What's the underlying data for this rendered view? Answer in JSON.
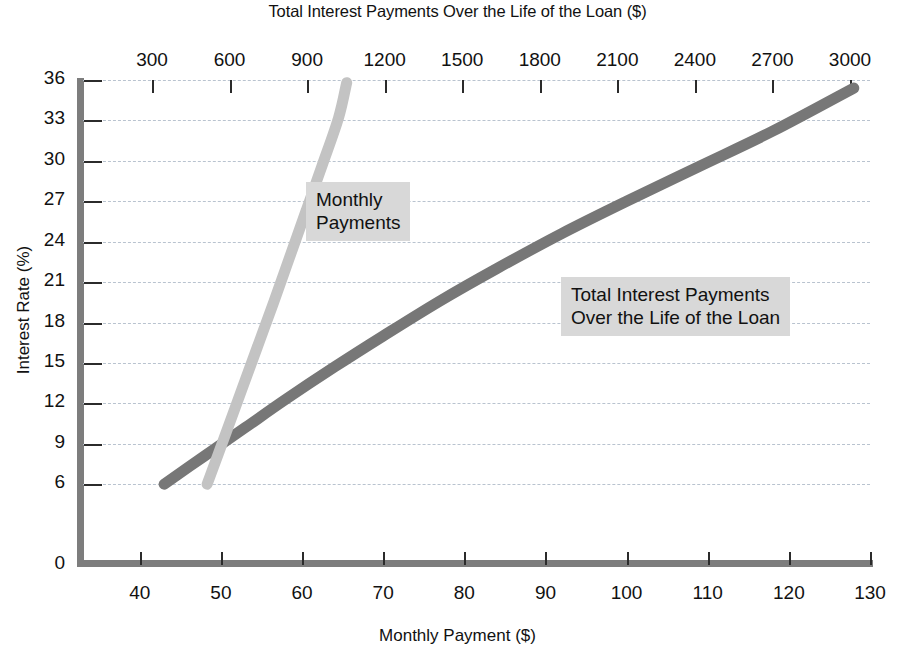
{
  "chart_data": {
    "type": "line",
    "title": "Total Interest Payments Over the Life of the Loan ($)",
    "xlabel": "Monthly Payment ($)",
    "ylabel": "Interest Rate (%)",
    "top_axis_label": "Total Interest Payments Over the Life of the Loan ($)",
    "grid": true,
    "legend_position": "inline-annotations",
    "xlim": [
      33,
      130
    ],
    "ylim": [
      0,
      36
    ],
    "top_xlim": [
      0,
      3060
    ],
    "x_ticks": [
      40,
      50,
      60,
      70,
      80,
      90,
      100,
      110,
      120,
      130
    ],
    "y_ticks": [
      0,
      6,
      9,
      12,
      15,
      18,
      21,
      24,
      27,
      30,
      33,
      36
    ],
    "top_ticks": [
      300,
      600,
      900,
      1200,
      1500,
      1800,
      2100,
      2400,
      2700,
      3000
    ],
    "series": [
      {
        "name": "Monthly Payments",
        "color": "#c3c3c3",
        "axis": "bottom",
        "x": [
          48.3,
          50.5,
          52.5,
          54.5,
          56.5,
          58.5,
          60.5,
          62.5,
          64.5,
          65.5
        ],
        "values": [
          6,
          9.6,
          12.9,
          16.2,
          19.5,
          22.9,
          26.3,
          29.7,
          33.2,
          35.8
        ]
      },
      {
        "name": "Total Interest Payments Over the Life of the Loan",
        "color": "#777777",
        "axis": "top",
        "x": [
          43,
          48,
          53,
          58,
          64,
          70,
          77,
          84,
          92,
          100,
          109,
          118,
          128
        ],
        "values": [
          6,
          8.1,
          10.2,
          12.3,
          14.7,
          17.0,
          19.6,
          22.0,
          24.6,
          27.0,
          29.6,
          32.2,
          35.4
        ],
        "top_x": [
          330,
          510,
          700,
          890,
          1110,
          1330,
          1580,
          1830,
          2110,
          2390,
          2700,
          3010,
          3310
        ]
      }
    ],
    "annotations": [
      {
        "id": "monthly",
        "text": "Monthly\nPayments"
      },
      {
        "id": "total",
        "text": "Total Interest Payments\nOver the Life of the Loan"
      }
    ]
  },
  "axes": {
    "top_title": "Total Interest Payments Over the Life of the Loan ($)",
    "bottom_title": "Monthly Payment ($)",
    "y_title": "Interest Rate (%)",
    "y_tick_labels": [
      "36",
      "33",
      "30",
      "27",
      "24",
      "21",
      "18",
      "15",
      "12",
      "9",
      "6",
      "0"
    ],
    "x_tick_labels": [
      "40",
      "50",
      "60",
      "70",
      "80",
      "90",
      "100",
      "110",
      "120",
      "130"
    ],
    "top_tick_labels": [
      "300",
      "600",
      "900",
      "1200",
      "1500",
      "1800",
      "2100",
      "2400",
      "2700",
      "3000"
    ]
  },
  "annotations": {
    "monthly_line1": "Monthly",
    "monthly_line2": "Payments",
    "total_line1": "Total Interest Payments",
    "total_line2": "Over the Life of the Loan"
  },
  "colors": {
    "monthly_curve": "#c3c3c3",
    "total_curve": "#777777",
    "grid": "#b9c3cf",
    "axis": "#7d7d7d",
    "annotation_bg": "#d8d8d8"
  }
}
